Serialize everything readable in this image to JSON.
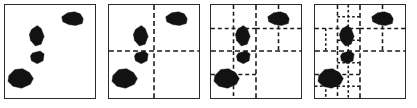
{
  "figure": {
    "background_color": "#ffffff",
    "border_color": "#2b2b2b",
    "blob_color": "#121212",
    "divider_color": "#1a1a1a",
    "panel_count": 4
  },
  "panels": [
    {
      "name": "panel-level-0",
      "label": "",
      "left": 4,
      "subdivision_level": 0,
      "dividers": []
    },
    {
      "name": "panel-level-1",
      "label": "",
      "left": 108,
      "subdivision_level": 1,
      "dividers": [
        {
          "name": "vertical-center",
          "x1": 46,
          "y1": 0,
          "x2": 46,
          "y2": 95,
          "level": 1
        },
        {
          "name": "horizontal-center",
          "x1": 0,
          "y1": 47,
          "x2": 92,
          "y2": 47,
          "level": 1
        }
      ]
    },
    {
      "name": "panel-level-2",
      "label": "",
      "left": 210,
      "subdivision_level": 2,
      "dividers": [
        {
          "name": "vertical-center",
          "x1": 46,
          "y1": 0,
          "x2": 46,
          "y2": 95,
          "level": 1
        },
        {
          "name": "horizontal-center",
          "x1": 0,
          "y1": 47,
          "x2": 92,
          "y2": 47,
          "level": 1
        },
        {
          "name": "tl-vertical",
          "x1": 23,
          "y1": 0,
          "x2": 23,
          "y2": 47,
          "level": 2
        },
        {
          "name": "tl-horizontal",
          "x1": 0,
          "y1": 24,
          "x2": 46,
          "y2": 24,
          "level": 2
        },
        {
          "name": "tr-vertical",
          "x1": 69,
          "y1": 0,
          "x2": 69,
          "y2": 47,
          "level": 2
        },
        {
          "name": "tr-horizontal",
          "x1": 46,
          "y1": 24,
          "x2": 92,
          "y2": 24,
          "level": 2
        },
        {
          "name": "bl-vertical",
          "x1": 23,
          "y1": 47,
          "x2": 23,
          "y2": 95,
          "level": 2
        },
        {
          "name": "bl-horizontal",
          "x1": 0,
          "y1": 71,
          "x2": 46,
          "y2": 71,
          "level": 2
        }
      ]
    },
    {
      "name": "panel-level-3",
      "label": "",
      "left": 314,
      "subdivision_level": 3,
      "dividers": [
        {
          "name": "vertical-center",
          "x1": 46,
          "y1": 0,
          "x2": 46,
          "y2": 95,
          "level": 1
        },
        {
          "name": "horizontal-center",
          "x1": 0,
          "y1": 47,
          "x2": 92,
          "y2": 47,
          "level": 1
        },
        {
          "name": "tl-vertical",
          "x1": 23,
          "y1": 0,
          "x2": 23,
          "y2": 47,
          "level": 2
        },
        {
          "name": "tl-horizontal",
          "x1": 0,
          "y1": 24,
          "x2": 46,
          "y2": 24,
          "level": 2
        },
        {
          "name": "tr-vertical",
          "x1": 69,
          "y1": 0,
          "x2": 69,
          "y2": 47,
          "level": 2
        },
        {
          "name": "tr-horizontal",
          "x1": 46,
          "y1": 24,
          "x2": 92,
          "y2": 24,
          "level": 2
        },
        {
          "name": "bl-vertical",
          "x1": 23,
          "y1": 47,
          "x2": 23,
          "y2": 95,
          "level": 2
        },
        {
          "name": "bl-horizontal",
          "x1": 0,
          "y1": 71,
          "x2": 46,
          "y2": 71,
          "level": 2
        },
        {
          "name": "tl-b-vertical",
          "x1": 34,
          "y1": 0,
          "x2": 34,
          "y2": 47,
          "level": 3
        },
        {
          "name": "tl-b-horizontal",
          "x1": 23,
          "y1": 12,
          "x2": 46,
          "y2": 12,
          "level": 3
        },
        {
          "name": "tl-c-horizontal",
          "x1": 23,
          "y1": 36,
          "x2": 46,
          "y2": 36,
          "level": 3
        },
        {
          "name": "tl-d-vertical",
          "x1": 11,
          "y1": 24,
          "x2": 11,
          "y2": 47,
          "level": 3
        },
        {
          "name": "bl-b-vertical",
          "x1": 34,
          "y1": 47,
          "x2": 34,
          "y2": 95,
          "level": 3
        },
        {
          "name": "bl-b-horizontal",
          "x1": 23,
          "y1": 59,
          "x2": 46,
          "y2": 59,
          "level": 3
        },
        {
          "name": "bl-c-horizontal",
          "x1": 23,
          "y1": 83,
          "x2": 46,
          "y2": 83,
          "level": 3
        },
        {
          "name": "bl-d-vertical",
          "x1": 11,
          "y1": 71,
          "x2": 11,
          "y2": 95,
          "level": 3
        },
        {
          "name": "bl-e-horizontal",
          "x1": 0,
          "y1": 83,
          "x2": 23,
          "y2": 83,
          "level": 3
        }
      ]
    }
  ],
  "blobs": [
    {
      "name": "blob-top-right",
      "points": "58,12 64,8 71,7 77,9 80,14 79,19 72,21 65,20 59,17",
      "centroid": [
        69,
        14
      ]
    },
    {
      "name": "blob-upper-left-diamond",
      "points": "27,25 33,21 37,24 40,32 37,40 31,42 26,36 25,30",
      "centroid": [
        33,
        31
      ]
    },
    {
      "name": "blob-small-middle",
      "points": "28,49 36,47 40,50 39,57 33,60 27,57 26,52",
      "centroid": [
        33,
        53
      ]
    },
    {
      "name": "blob-bottom-left",
      "points": "4,72 10,66 18,65 25,69 29,75 26,81 17,85 8,83 3,78",
      "centroid": [
        15,
        75
      ]
    }
  ]
}
